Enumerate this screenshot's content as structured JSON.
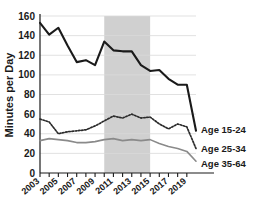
{
  "chart_data": {
    "type": "line",
    "title": "",
    "xlabel": "",
    "ylabel": "Minutes per Day",
    "ylim": [
      0,
      160
    ],
    "xlim": [
      2003,
      2020
    ],
    "ytick_labels": [
      "0",
      "20",
      "40",
      "60",
      "80",
      "100",
      "120",
      "140",
      "160"
    ],
    "ytick_values": [
      0,
      20,
      40,
      60,
      80,
      100,
      120,
      140,
      160
    ],
    "xtick_labels": [
      "2003",
      "2005",
      "2007",
      "2009",
      "2011",
      "2013",
      "2015",
      "2017",
      "2019"
    ],
    "xtick_values": [
      2003,
      2005,
      2007,
      2009,
      2011,
      2013,
      2015,
      2017,
      2019
    ],
    "x": [
      2003,
      2004,
      2005,
      2006,
      2007,
      2008,
      2009,
      2010,
      2011,
      2012,
      2013,
      2014,
      2015,
      2016,
      2017,
      2018,
      2019,
      2020
    ],
    "grid": true,
    "legend_position": "right-inline",
    "shaded_region": {
      "label": "",
      "x_start": 2010,
      "x_end": 2015,
      "color": "#c8c8c8"
    },
    "series": [
      {
        "name": "Age 15-24",
        "color": "#1a1a1a",
        "style": "solid",
        "width": 2.1,
        "values": [
          153,
          141,
          148,
          130,
          113,
          115,
          110,
          134,
          125,
          124,
          124,
          110,
          104,
          105,
          96,
          90,
          90,
          43
        ]
      },
      {
        "name": "Age 25-34",
        "color": "#2b2b2b",
        "style": "dotted",
        "width": 1.7,
        "values": [
          55,
          52,
          40,
          42,
          43,
          44,
          48,
          53,
          58,
          56,
          60,
          56,
          57,
          50,
          45,
          50,
          47,
          25
        ]
      },
      {
        "name": "Age 35-64",
        "color": "#8a8a8a",
        "style": "solid",
        "width": 1.6,
        "values": [
          33,
          35,
          34,
          33,
          31,
          31,
          32,
          34,
          35,
          33,
          34,
          33,
          34,
          30,
          27,
          25,
          22,
          12
        ]
      }
    ]
  },
  "legend": {
    "items": [
      {
        "label": "Age 15-24"
      },
      {
        "label": "Age 25-34"
      },
      {
        "label": "Age 35-64"
      }
    ]
  }
}
